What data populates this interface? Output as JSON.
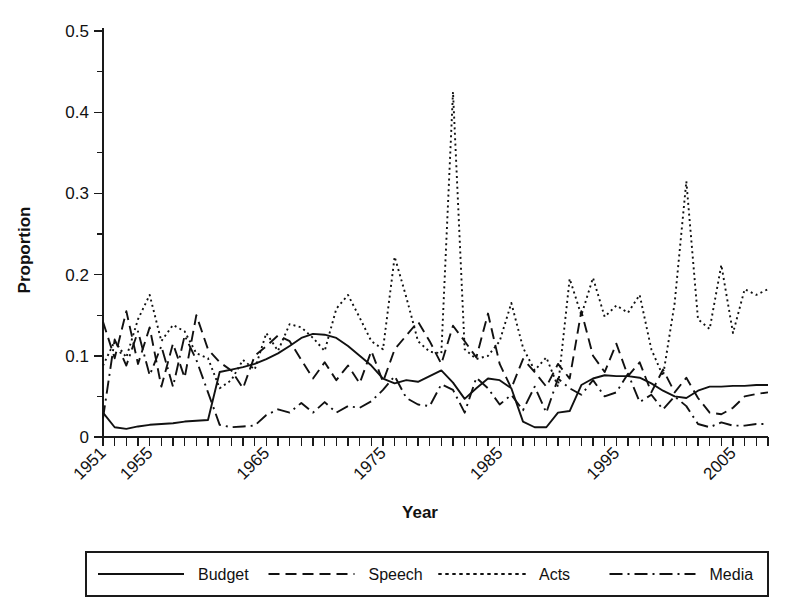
{
  "chart_data": {
    "type": "line",
    "title": "",
    "xlabel": "Year",
    "ylabel": "Proportion",
    "xlim": [
      1951,
      2008
    ],
    "ylim": [
      0,
      0.5
    ],
    "grid": false,
    "legend_position": "bottom",
    "y_ticks": [
      "0",
      "0.1",
      "0.2",
      "0.3",
      "0.4",
      "0.5"
    ],
    "y_tick_values": [
      0,
      0.1,
      0.2,
      0.3,
      0.4,
      0.5
    ],
    "y_minor_ticks": [
      0.05,
      0.15,
      0.25,
      0.35,
      0.45
    ],
    "x_ticks_labeled": [
      "1951",
      "1955",
      "1965",
      "1975",
      "1985",
      "1995",
      "2005"
    ],
    "x_tick_values": [
      1951,
      1955,
      1965,
      1975,
      1985,
      1995,
      2005
    ],
    "x_all_year_ticks_from": 1951,
    "x_all_year_ticks_to": 2008,
    "x": [
      1951,
      1952,
      1953,
      1954,
      1955,
      1956,
      1957,
      1958,
      1959,
      1960,
      1961,
      1962,
      1963,
      1964,
      1965,
      1966,
      1967,
      1968,
      1969,
      1970,
      1971,
      1972,
      1973,
      1974,
      1975,
      1976,
      1977,
      1978,
      1979,
      1980,
      1981,
      1982,
      1983,
      1984,
      1985,
      1986,
      1987,
      1988,
      1989,
      1990,
      1991,
      1992,
      1993,
      1994,
      1995,
      1996,
      1997,
      1998,
      1999,
      2000,
      2001,
      2002,
      2003,
      2004,
      2005,
      2006,
      2007,
      2008
    ],
    "series": [
      {
        "name": "Budget",
        "style": "solid",
        "values": [
          0.03,
          0.012,
          0.01,
          0.013,
          0.015,
          0.016,
          0.017,
          0.019,
          0.02,
          0.021,
          0.08,
          0.083,
          0.086,
          0.09,
          0.096,
          0.103,
          0.112,
          0.122,
          0.127,
          0.126,
          0.122,
          0.112,
          0.1,
          0.088,
          0.072,
          0.066,
          0.07,
          0.068,
          0.075,
          0.082,
          0.067,
          0.047,
          0.06,
          0.072,
          0.07,
          0.06,
          0.019,
          0.012,
          0.012,
          0.03,
          0.032,
          0.064,
          0.072,
          0.076,
          0.075,
          0.075,
          0.073,
          0.066,
          0.057,
          0.05,
          0.048,
          0.057,
          0.062,
          0.062,
          0.063,
          0.063,
          0.064,
          0.064
        ]
      },
      {
        "name": "Speech",
        "style": "dashed",
        "values": [
          0.142,
          0.097,
          0.155,
          0.09,
          0.135,
          0.062,
          0.115,
          0.073,
          0.15,
          0.108,
          0.092,
          0.082,
          0.06,
          0.1,
          0.112,
          0.125,
          0.118,
          0.095,
          0.072,
          0.092,
          0.07,
          0.088,
          0.066,
          0.106,
          0.068,
          0.108,
          0.125,
          0.142,
          0.118,
          0.09,
          0.137,
          0.118,
          0.098,
          0.152,
          0.09,
          0.06,
          0.096,
          0.08,
          0.062,
          0.09,
          0.072,
          0.155,
          0.1,
          0.08,
          0.115,
          0.075,
          0.092,
          0.055,
          0.083,
          0.055,
          0.073,
          0.048,
          0.03,
          0.028,
          0.036,
          0.05,
          0.053,
          0.055
        ]
      },
      {
        "name": "Acts",
        "style": "dotted",
        "values": [
          0.088,
          0.118,
          0.098,
          0.145,
          0.175,
          0.118,
          0.138,
          0.13,
          0.103,
          0.097,
          0.06,
          0.07,
          0.095,
          0.083,
          0.128,
          0.106,
          0.139,
          0.135,
          0.122,
          0.106,
          0.158,
          0.175,
          0.147,
          0.118,
          0.108,
          0.222,
          0.172,
          0.118,
          0.105,
          0.103,
          0.425,
          0.108,
          0.096,
          0.1,
          0.118,
          0.165,
          0.11,
          0.082,
          0.098,
          0.062,
          0.195,
          0.15,
          0.196,
          0.148,
          0.162,
          0.153,
          0.175,
          0.108,
          0.075,
          0.165,
          0.315,
          0.145,
          0.133,
          0.212,
          0.128,
          0.182,
          0.175,
          0.182
        ]
      },
      {
        "name": "Media",
        "style": "dashdot",
        "values": [
          0.023,
          0.12,
          0.088,
          0.13,
          0.076,
          0.112,
          0.062,
          0.125,
          0.095,
          0.055,
          0.015,
          0.012,
          0.013,
          0.014,
          0.027,
          0.034,
          0.03,
          0.042,
          0.03,
          0.043,
          0.03,
          0.038,
          0.036,
          0.044,
          0.058,
          0.075,
          0.048,
          0.04,
          0.038,
          0.065,
          0.058,
          0.03,
          0.073,
          0.06,
          0.04,
          0.052,
          0.033,
          0.062,
          0.03,
          0.072,
          0.06,
          0.052,
          0.07,
          0.05,
          0.055,
          0.078,
          0.043,
          0.052,
          0.034,
          0.05,
          0.038,
          0.016,
          0.012,
          0.018,
          0.014,
          0.014,
          0.016,
          0.016
        ]
      }
    ]
  },
  "legend": {
    "items": [
      {
        "label": "Budget",
        "style": "solid"
      },
      {
        "label": "Speech",
        "style": "dashed"
      },
      {
        "label": "Acts",
        "style": "dotted"
      },
      {
        "label": "Media",
        "style": "dashdot"
      }
    ]
  }
}
